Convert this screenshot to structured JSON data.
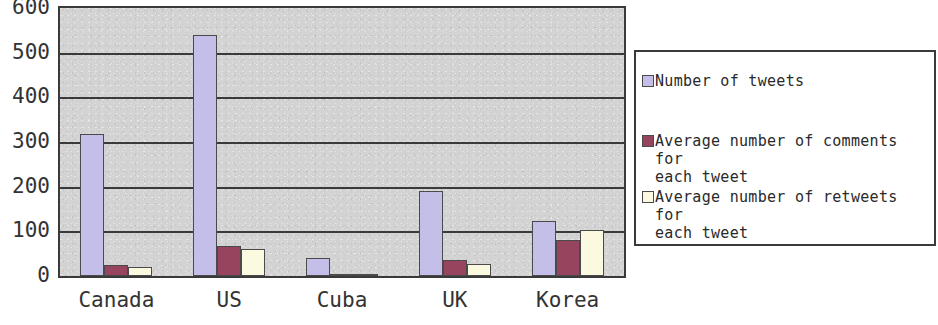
{
  "chart_data": {
    "type": "bar",
    "title": "",
    "xlabel": "",
    "ylabel": "",
    "categories": [
      "Canada",
      "US",
      "Cuba",
      "UK",
      "Korea"
    ],
    "ylim": [
      0,
      600
    ],
    "yticks": [
      0,
      100,
      200,
      300,
      400,
      500,
      600
    ],
    "ytick_labels": [
      "0",
      "100",
      "200",
      "300",
      "400",
      "500",
      "600"
    ],
    "grid": true,
    "legend_position": "right",
    "series": [
      {
        "name": "Number of tweets",
        "color": "#c3bfe8",
        "values": [
          318,
          540,
          40,
          190,
          123
        ]
      },
      {
        "name": "Average number of comments for each tweet",
        "color": "#97445f",
        "values": [
          25,
          68,
          5,
          35,
          80
        ]
      },
      {
        "name": "Average number of retweets for each tweet",
        "color": "#fbf9df",
        "values": [
          20,
          60,
          2,
          28,
          103
        ]
      }
    ]
  },
  "axes": {
    "y_ticks": [
      {
        "label": "600",
        "value": 600
      },
      {
        "label": "500",
        "value": 500
      },
      {
        "label": "400",
        "value": 400
      },
      {
        "label": "300",
        "value": 300
      },
      {
        "label": "200",
        "value": 200
      },
      {
        "label": "100",
        "value": 100
      },
      {
        "label": "0",
        "value": 0
      }
    ],
    "x_categories": [
      {
        "label": "Canada"
      },
      {
        "label": "US"
      },
      {
        "label": "Cuba"
      },
      {
        "label": "UK"
      },
      {
        "label": "Korea"
      }
    ]
  },
  "legend": {
    "entries": [
      {
        "label": "Number of tweets",
        "color": "#c3bfe8"
      },
      {
        "label": "Average number of comments for\neach tweet",
        "color": "#97445f"
      },
      {
        "label": "Average number of retweets for\neach tweet",
        "color": "#fbf9df"
      }
    ]
  },
  "colors": {
    "plot_background": "#d3d3d3",
    "axis_line": "#3a3a3a",
    "page_background": "#ffffff",
    "text": "#2a2a2a"
  }
}
